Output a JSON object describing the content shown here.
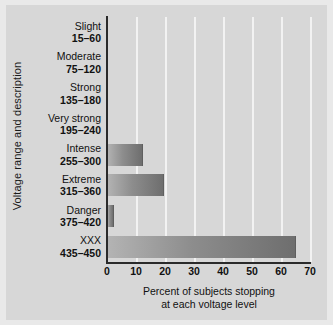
{
  "chart_data": {
    "type": "bar",
    "orientation": "horizontal",
    "title": "",
    "xlabel_line1": "Percent of subjects stopping",
    "xlabel_line2": "at each voltage level",
    "ylabel": "Voltage range and description",
    "categories": [
      {
        "name": "Slight",
        "range": "15–60"
      },
      {
        "name": "Moderate",
        "range": "75–120"
      },
      {
        "name": "Strong",
        "range": "135–180"
      },
      {
        "name": "Very strong",
        "range": "195–240"
      },
      {
        "name": "Intense",
        "range": "255–300"
      },
      {
        "name": "Extreme",
        "range": "315–360"
      },
      {
        "name": "Danger",
        "range": "375–420"
      },
      {
        "name": "XXX",
        "range": "435–450"
      }
    ],
    "values": [
      0,
      0,
      0,
      0,
      12.5,
      19.5,
      2.5,
      65
    ],
    "xlim": [
      0,
      70
    ],
    "xticks": [
      0,
      10,
      20,
      30,
      40,
      50,
      60,
      70
    ],
    "xtick_labels": [
      "0",
      "10",
      "20",
      "30",
      "40",
      "50",
      "60",
      "70"
    ],
    "grid": "vertical-white",
    "legend": "none",
    "colors": {
      "background": "#d7d7d7",
      "figure_background": "#e9e9e9",
      "gridline": "#f2f2f2",
      "axis": "#2a2a2a",
      "bar_light": "#b4b4b4",
      "bar_dark": "#6e6e6e",
      "text": "#111111"
    }
  }
}
